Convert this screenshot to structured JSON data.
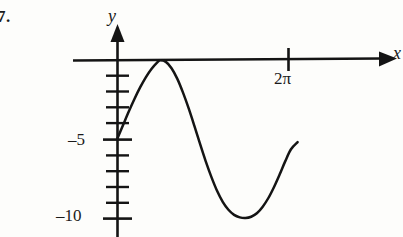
{
  "figure": {
    "problem_number": "7.",
    "axes": {
      "x_label": "x",
      "y_label": "y",
      "x_axis_y_px": 60,
      "y_axis_x_px": 117,
      "x_tick_labels": [
        "2π"
      ],
      "y_tick_labels": [
        "–5",
        "–10"
      ]
    },
    "colors": {
      "ink": "#141414",
      "background": "#fdfdfb"
    }
  },
  "chart_data": {
    "type": "line",
    "title": "",
    "xlabel": "x",
    "ylabel": "y",
    "xlim": [
      0,
      7.6
    ],
    "ylim": [
      -11.5,
      0.6
    ],
    "grid": false,
    "legend": null,
    "annotations": [
      "7."
    ],
    "x_ticks": [
      6.283185
    ],
    "x_tick_labels": [
      "2π"
    ],
    "y_ticks": [
      -1,
      -2,
      -3,
      -4,
      -5,
      -6,
      -7,
      -8,
      -9,
      -10
    ],
    "y_tick_labels_shown": {
      "-5": "–5",
      "-10": "–10"
    },
    "series": [
      {
        "name": "curve",
        "x": [
          0.0,
          0.18,
          0.36,
          0.54,
          0.72,
          0.9,
          1.08,
          1.26,
          1.35,
          1.53,
          1.71,
          1.89,
          2.07,
          2.25,
          2.43,
          2.61,
          2.79,
          2.97,
          3.15,
          3.33,
          3.51,
          3.69,
          3.87,
          4.05,
          4.23,
          4.41,
          4.59,
          4.77,
          4.95,
          5.13,
          5.31,
          5.49,
          5.7
        ],
        "y": [
          -4.95,
          -4.1,
          -3.25,
          -2.45,
          -1.72,
          -1.08,
          -0.55,
          -0.15,
          -0.02,
          -0.12,
          -0.52,
          -1.18,
          -2.05,
          -3.05,
          -4.15,
          -5.3,
          -6.4,
          -7.4,
          -8.28,
          -8.98,
          -9.48,
          -9.8,
          -9.96,
          -10.0,
          -9.92,
          -9.7,
          -9.3,
          -8.75,
          -8.05,
          -7.25,
          -6.4,
          -5.65,
          -5.2
        ]
      }
    ]
  }
}
